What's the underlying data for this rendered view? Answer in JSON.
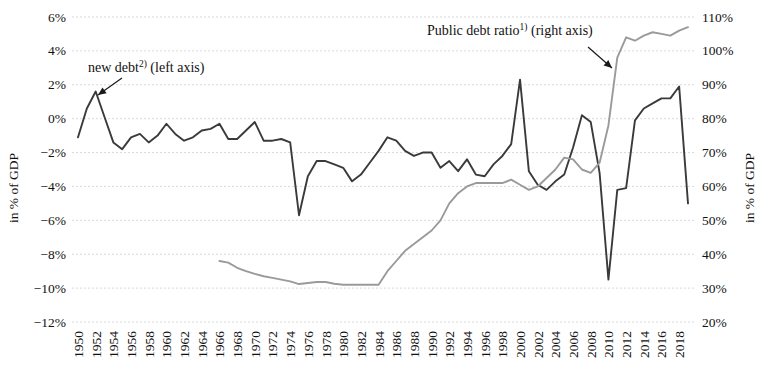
{
  "chart_data": {
    "type": "line",
    "title": "",
    "subtitle": "",
    "ylabel": "in % of GDP",
    "ylabel_right": "in % of GDP",
    "xlabel": "",
    "grid": true,
    "legend_position": "inline-annotations",
    "ylim": [
      -12,
      6
    ],
    "ylim_right": [
      20,
      110
    ],
    "yticks": [
      "6%",
      "4%",
      "2%",
      "0%",
      "-2%",
      "-4%",
      "-6%",
      "-8%",
      "-10%",
      "-12%"
    ],
    "ytick_values": [
      6,
      4,
      2,
      0,
      -2,
      -4,
      -6,
      -8,
      -10,
      -12
    ],
    "yticks_right": [
      "110%",
      "100%",
      "90%",
      "80%",
      "70%",
      "60%",
      "50%",
      "40%",
      "30%",
      "20%"
    ],
    "ytick_values_right": [
      110,
      100,
      90,
      80,
      70,
      60,
      50,
      40,
      30,
      20
    ],
    "xticks": [
      "1950",
      "1952",
      "1954",
      "1956",
      "1958",
      "1960",
      "1962",
      "1964",
      "1966",
      "1968",
      "1970",
      "1972",
      "1974",
      "1976",
      "1978",
      "1980",
      "1982",
      "1984",
      "1986",
      "1988",
      "1990",
      "1992",
      "1994",
      "1996",
      "1998",
      "2000",
      "2002",
      "2004",
      "2006",
      "2008",
      "2010",
      "2012",
      "2014",
      "2016",
      "2018"
    ],
    "xlim": [
      1950,
      2019
    ],
    "annotations": [
      {
        "name": "new-debt-label",
        "text": "new debt",
        "sup": "2)",
        "tail": " (left axis)",
        "x": 88,
        "y": 72
      },
      {
        "name": "public-debt-ratio-label",
        "text": "Public debt ratio",
        "sup": "1)",
        "tail": " (right axis)",
        "x": 427,
        "y": 35
      }
    ],
    "series": [
      {
        "name": "new debt",
        "axis": "left",
        "color": "#3a3a3a",
        "x": [
          1950,
          1951,
          1952,
          1953,
          1954,
          1955,
          1956,
          1957,
          1958,
          1959,
          1960,
          1961,
          1962,
          1963,
          1964,
          1965,
          1966,
          1967,
          1968,
          1969,
          1970,
          1971,
          1972,
          1973,
          1974,
          1975,
          1976,
          1977,
          1978,
          1979,
          1980,
          1981,
          1982,
          1983,
          1984,
          1985,
          1986,
          1987,
          1988,
          1989,
          1990,
          1991,
          1992,
          1993,
          1994,
          1995,
          1996,
          1997,
          1998,
          1999,
          2000,
          2001,
          2002,
          2003,
          2004,
          2005,
          2006,
          2007,
          2008,
          2009,
          2010,
          2011,
          2012,
          2013,
          2014,
          2015,
          2016,
          2017,
          2018,
          2019
        ],
        "values": [
          -1.1,
          0.6,
          1.6,
          0.1,
          -1.4,
          -1.8,
          -1.1,
          -0.9,
          -1.4,
          -1.0,
          -0.3,
          -0.9,
          -1.3,
          -1.1,
          -0.7,
          -0.6,
          -0.3,
          -1.2,
          -1.2,
          -0.7,
          -0.2,
          -1.3,
          -1.3,
          -1.2,
          -1.4,
          -5.7,
          -3.4,
          -2.5,
          -2.5,
          -2.7,
          -2.9,
          -3.7,
          -3.3,
          -2.6,
          -1.9,
          -1.1,
          -1.3,
          -1.9,
          -2.2,
          -2.0,
          -2.0,
          -2.9,
          -2.5,
          -3.1,
          -2.4,
          -3.3,
          -3.4,
          -2.7,
          -2.2,
          -1.5,
          2.3,
          -3.1,
          -3.9,
          -4.2,
          -3.7,
          -3.3,
          -1.7,
          0.2,
          -0.2,
          -3.2,
          -9.5,
          -4.2,
          -4.1,
          -0.1,
          0.6,
          0.9,
          1.2,
          1.2,
          1.9,
          -5.0
        ]
      },
      {
        "name": "Public debt ratio",
        "axis": "right",
        "color": "#9a9a9a",
        "x": [
          1966,
          1967,
          1968,
          1969,
          1970,
          1971,
          1972,
          1973,
          1974,
          1975,
          1976,
          1977,
          1978,
          1979,
          1980,
          1981,
          1982,
          1983,
          1984,
          1985,
          1986,
          1987,
          1988,
          1989,
          1990,
          1991,
          1992,
          1993,
          1994,
          1995,
          1996,
          1997,
          1998,
          1999,
          2000,
          2001,
          2002,
          2003,
          2004,
          2005,
          2006,
          2007,
          2008,
          2009,
          2010,
          2011,
          2012,
          2013,
          2014,
          2015,
          2016,
          2017,
          2018,
          2019
        ],
        "values": [
          38,
          37.5,
          36,
          35,
          34.2,
          33.5,
          33,
          32.5,
          32,
          31.2,
          31.5,
          31.8,
          31.8,
          31.3,
          31,
          31,
          31,
          31,
          31,
          35,
          38,
          41,
          43,
          45,
          47,
          50,
          55,
          58,
          60,
          61,
          61,
          61,
          61,
          62,
          60.5,
          59,
          60,
          62.5,
          65,
          68.5,
          68,
          65,
          64,
          67,
          78,
          98,
          104,
          103,
          104.5,
          105.5,
          105,
          104.5,
          106,
          107
        ]
      }
    ]
  },
  "axis": {
    "left_title": "in % of GDP",
    "right_title": "in % of GDP"
  }
}
